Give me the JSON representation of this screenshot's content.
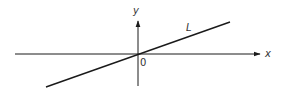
{
  "diagram": {
    "axes": {
      "x_label": "x",
      "y_label": "y",
      "origin_label": "0"
    },
    "line": {
      "label": "L",
      "passes_through_origin": true,
      "slope_sign": "positive"
    },
    "colors": {
      "stroke": "#1a1a1a",
      "text": "#333333",
      "background": "#ffffff"
    }
  }
}
